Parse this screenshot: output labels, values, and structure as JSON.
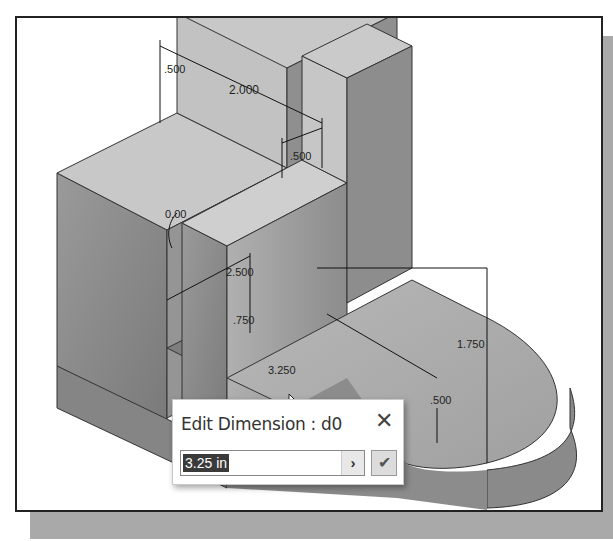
{
  "viewport": {
    "dimensions": [
      {
        "id": "width-top",
        "label": ".500"
      },
      {
        "id": "overall-slot",
        "label": "2.000"
      },
      {
        "id": "width-mid",
        "label": ".500"
      },
      {
        "id": "angle",
        "label": "0.00"
      },
      {
        "id": "depth",
        "label": "2.500"
      },
      {
        "id": "step-height",
        "label": ".750"
      },
      {
        "id": "length",
        "label": "3.250"
      },
      {
        "id": "height",
        "label": "1.750"
      },
      {
        "id": "base-thickness",
        "label": ".500"
      }
    ]
  },
  "dialog": {
    "title": "Edit Dimension : d0",
    "close_glyph": "✕",
    "input_value": "3.25 in",
    "arrow_glyph": "›",
    "ok_glyph": "✔"
  },
  "colors": {
    "part_top": "#c4c4c4",
    "part_front": "#8f8f8f",
    "part_side": "#a6a6a6",
    "frame_shadow": "#a9a9a9"
  }
}
